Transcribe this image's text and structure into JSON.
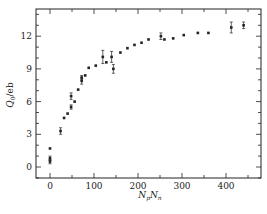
{
  "chart_data": {
    "type": "scatter",
    "title": "",
    "xlabel": "N_p N_n",
    "ylabel": "Q_0 / eb",
    "xlim": [
      -30,
      470
    ],
    "ylim": [
      -1,
      14.5
    ],
    "xticks": [
      0,
      100,
      200,
      300,
      400
    ],
    "yticks": [
      0,
      3,
      6,
      9,
      12
    ],
    "grid": false,
    "legend": null,
    "series": [
      {
        "name": "data",
        "points": [
          {
            "x": 0,
            "y": 0.5,
            "err": 0.2
          },
          {
            "x": 0,
            "y": 0.8,
            "err": 0.2
          },
          {
            "x": 0,
            "y": 1.7,
            "err": 0.1
          },
          {
            "x": 24,
            "y": 3.3,
            "err": 0.3
          },
          {
            "x": 32,
            "y": 4.5,
            "err": 0.1
          },
          {
            "x": 40,
            "y": 4.9,
            "err": 0.1
          },
          {
            "x": 48,
            "y": 5.5,
            "err": 0.2
          },
          {
            "x": 48,
            "y": 6.5,
            "err": 0.3
          },
          {
            "x": 56,
            "y": 6.0,
            "err": 0.1
          },
          {
            "x": 64,
            "y": 7.1,
            "err": 0.1
          },
          {
            "x": 72,
            "y": 7.9,
            "err": 0.3
          },
          {
            "x": 72,
            "y": 8.2,
            "err": 0.2
          },
          {
            "x": 80,
            "y": 8.4,
            "err": 0.1
          },
          {
            "x": 88,
            "y": 9.1,
            "err": 0.1
          },
          {
            "x": 104,
            "y": 9.3,
            "err": 0.1
          },
          {
            "x": 120,
            "y": 10.1,
            "err": 0.6
          },
          {
            "x": 128,
            "y": 9.6,
            "err": 0.1
          },
          {
            "x": 140,
            "y": 10.1,
            "err": 0.5
          },
          {
            "x": 144,
            "y": 9.0,
            "err": 0.4
          },
          {
            "x": 160,
            "y": 10.5,
            "err": 0.1
          },
          {
            "x": 176,
            "y": 10.9,
            "err": 0.1
          },
          {
            "x": 192,
            "y": 11.2,
            "err": 0.1
          },
          {
            "x": 208,
            "y": 11.4,
            "err": 0.1
          },
          {
            "x": 224,
            "y": 11.7,
            "err": 0.1
          },
          {
            "x": 252,
            "y": 12.0,
            "err": 0.3
          },
          {
            "x": 260,
            "y": 11.7,
            "err": 0.1
          },
          {
            "x": 280,
            "y": 11.8,
            "err": 0.1
          },
          {
            "x": 304,
            "y": 12.1,
            "err": 0.1
          },
          {
            "x": 336,
            "y": 12.3,
            "err": 0.1
          },
          {
            "x": 360,
            "y": 12.3,
            "err": 0.1
          },
          {
            "x": 412,
            "y": 12.8,
            "err": 0.5
          },
          {
            "x": 440,
            "y": 13.0,
            "err": 0.3
          }
        ]
      }
    ]
  },
  "axes": {
    "x_tick_labels": [
      "0",
      "100",
      "200",
      "300",
      "400"
    ],
    "y_tick_labels": [
      "0",
      "3",
      "6",
      "9",
      "12"
    ],
    "x_title_main": "N",
    "x_title_sub1": "p",
    "x_title_main2": "N",
    "x_title_sub2": "n",
    "y_title_main": "Q",
    "y_title_sub": "0",
    "y_title_unit": "/eb"
  }
}
